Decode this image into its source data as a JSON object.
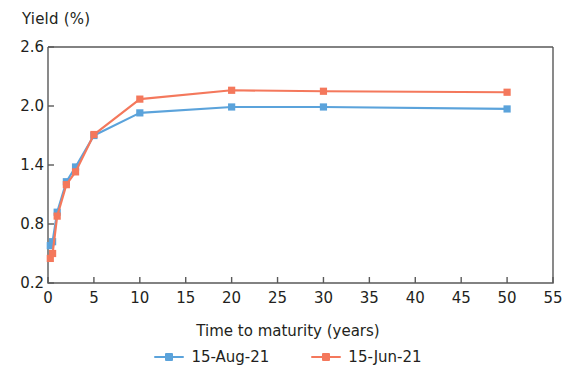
{
  "chart_data": {
    "type": "line",
    "title": "",
    "ylabel": "Yield (%)",
    "xlabel": "Time to maturity (years)",
    "xlim": [
      0,
      55
    ],
    "ylim": [
      0.2,
      2.6
    ],
    "xticks": [
      "0",
      "5",
      "10",
      "15",
      "20",
      "25",
      "30",
      "35",
      "40",
      "45",
      "50",
      "55"
    ],
    "xtick_values": [
      0,
      5,
      10,
      15,
      20,
      25,
      30,
      35,
      40,
      45,
      50,
      55
    ],
    "yticks": [
      "0.2",
      "0.8",
      "1.4",
      "2.0",
      "2.6"
    ],
    "ytick_values": [
      0.2,
      0.8,
      1.4,
      2.0,
      2.6
    ],
    "grid": false,
    "legend_position": "bottom",
    "x": [
      0.25,
      0.5,
      1,
      2,
      3,
      5,
      10,
      20,
      30,
      50
    ],
    "series": [
      {
        "name": "15-Aug-21",
        "color": "#5BA3DB",
        "marker": "square",
        "values": [
          0.58,
          0.62,
          0.92,
          1.23,
          1.38,
          1.7,
          1.93,
          1.99,
          1.99,
          1.97
        ]
      },
      {
        "name": "15-Jun-21",
        "color": "#F4785C",
        "marker": "square",
        "values": [
          0.45,
          0.5,
          0.88,
          1.2,
          1.33,
          1.71,
          2.07,
          2.16,
          2.15,
          2.14
        ]
      }
    ]
  },
  "legend": {
    "items": [
      {
        "label": "15-Aug-21",
        "color": "#5BA3DB"
      },
      {
        "label": "15-Jun-21",
        "color": "#F4785C"
      }
    ]
  },
  "axis": {
    "frame_color": "#595959"
  }
}
